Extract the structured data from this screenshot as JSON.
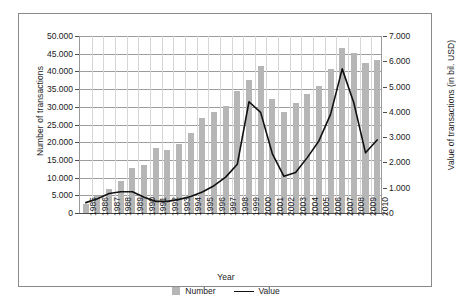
{
  "chart_data": {
    "type": "bar",
    "title": "",
    "xlabel": "Year",
    "ylabel": "Number of transactions",
    "y2label": "Value of transactions (in bil. USD)",
    "categories": [
      "1985",
      "1986",
      "1987",
      "1988",
      "1989",
      "1990",
      "1991",
      "1992",
      "1993",
      "1994",
      "1995",
      "1996",
      "1997",
      "1998",
      "1999",
      "2000",
      "2001",
      "2002",
      "2003",
      "2004",
      "2005",
      "2006",
      "2007",
      "2008",
      "2009",
      "2010"
    ],
    "series": [
      {
        "name": "Number",
        "type": "bar",
        "axis": "left",
        "color": "#b6b6b6",
        "values": [
          2500,
          4900,
          6800,
          9000,
          12700,
          13500,
          18300,
          17900,
          19500,
          22500,
          26700,
          28400,
          30200,
          34500,
          37700,
          41400,
          32200,
          28600,
          31000,
          33700,
          35900,
          40800,
          46500,
          45100,
          42400,
          43200
        ]
      },
      {
        "name": "Value",
        "type": "line",
        "axis": "right",
        "color": "#111111",
        "values": [
          0.41,
          0.56,
          0.77,
          0.84,
          0.84,
          0.62,
          0.46,
          0.46,
          0.54,
          0.65,
          0.83,
          1.08,
          1.42,
          1.93,
          4.4,
          3.98,
          2.35,
          1.45,
          1.6,
          2.19,
          2.85,
          3.9,
          5.7,
          4.35,
          2.38,
          2.89
        ]
      }
    ],
    "left_axis": {
      "ticks": [
        "0",
        "5.000",
        "10.000",
        "15.000",
        "20.000",
        "25.000",
        "30.000",
        "35.000",
        "40.000",
        "45.000",
        "50.000"
      ],
      "min": 0,
      "max": 50000,
      "step": 5000
    },
    "right_axis": {
      "ticks": [
        "0",
        "1.000",
        "2.000",
        "3.000",
        "4.000",
        "5.000",
        "6.000",
        "7.000"
      ],
      "min": 0,
      "max": 7,
      "step": 1
    },
    "legend": {
      "position": "bottom",
      "entries": [
        {
          "label": "Number",
          "marker": "square",
          "color": "#b6b6b6"
        },
        {
          "label": "Value",
          "marker": "line",
          "color": "#111111"
        }
      ]
    },
    "grid": true
  }
}
